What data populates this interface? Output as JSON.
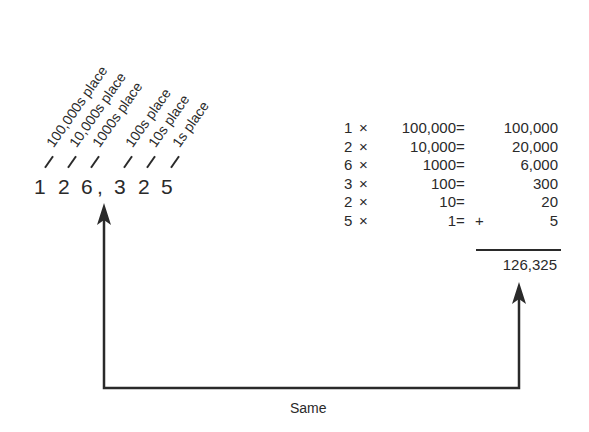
{
  "number": {
    "digits": [
      "1",
      "2",
      "6",
      ",",
      "3",
      "2",
      "5"
    ],
    "place_labels": [
      "100,000s place",
      "10,000s place",
      "1000s place",
      "100s place",
      "10s place",
      "1s place"
    ]
  },
  "expansion": {
    "rows": [
      {
        "multiplier": "1",
        "times": "×",
        "place_value": "100,000",
        "equals": "=",
        "plus": "",
        "result": "100,000"
      },
      {
        "multiplier": "2",
        "times": "×",
        "place_value": "10,000",
        "equals": "=",
        "plus": "",
        "result": "20,000"
      },
      {
        "multiplier": "6",
        "times": "×",
        "place_value": "1000",
        "equals": "=",
        "plus": "",
        "result": "6,000"
      },
      {
        "multiplier": "3",
        "times": "×",
        "place_value": "100",
        "equals": "=",
        "plus": "",
        "result": "300"
      },
      {
        "multiplier": "2",
        "times": "×",
        "place_value": "10",
        "equals": "=",
        "plus": "",
        "result": "20"
      },
      {
        "multiplier": "5",
        "times": "×",
        "place_value": "1",
        "equals": "=",
        "plus": "+",
        "result": "5"
      }
    ],
    "total": "126,325"
  },
  "connector": {
    "label": "Same",
    "color": "#2a2a2a"
  }
}
